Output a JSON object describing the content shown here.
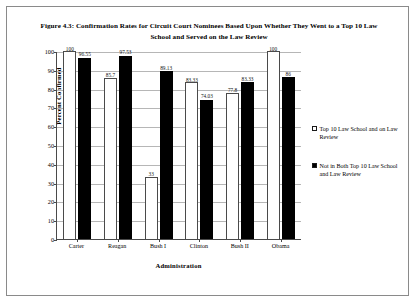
{
  "figure": {
    "title": "Figure 4.3: Confirmation Rates for Circuit Court Nominees Based Upon Whether They Went to a Top 10 Law School and Served on the Law Review"
  },
  "chart_data": {
    "type": "bar",
    "title": "Figure 4.3: Confirmation Rates for Circuit Court Nominees Based Upon Whether They Went to a Top 10 Law School and Served on the Law Review",
    "xlabel": "Administration",
    "ylabel": "Percent Confirmed",
    "categories": [
      "Carter",
      "Reagan",
      "Bush I",
      "Clinton",
      "Bush II",
      "Obama"
    ],
    "ylim": [
      0,
      100
    ],
    "yticks": [
      0,
      10,
      20,
      30,
      40,
      50,
      60,
      70,
      80,
      90,
      100
    ],
    "grid": true,
    "legend_position": "right",
    "series": [
      {
        "name": "Top 10 Law School and on Law Review",
        "color": "#ffffff",
        "values": [
          100,
          85.7,
          33,
          83.33,
          77.8,
          100
        ],
        "labels": [
          "100",
          "85.7",
          "33",
          "83.33",
          "77.8",
          "100"
        ]
      },
      {
        "name": "Not in Both Top 10 Law School and Law Review",
        "color": "#000000",
        "values": [
          96.55,
          97.53,
          89.13,
          74.03,
          83.33,
          86
        ],
        "labels": [
          "96.55",
          "97.53",
          "89.13",
          "74.03",
          "83.33",
          "86"
        ]
      }
    ]
  },
  "legend": {
    "entries": [
      {
        "label": "Top 10 Law School and on Law Review",
        "swatch": "light"
      },
      {
        "label": "Not in Both Top 10 Law School and Law Review",
        "swatch": "dark"
      }
    ]
  }
}
